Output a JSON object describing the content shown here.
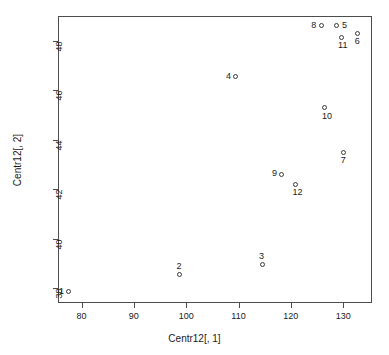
{
  "chart_data": {
    "type": "scatter",
    "title": "",
    "xlabel": "Centr12[, 1]",
    "ylabel": "Centr12[, 2]",
    "xlim": [
      75.5,
      135.5
    ],
    "ylim": [
      37.4,
      49.0
    ],
    "xticks": [
      80,
      90,
      100,
      110,
      120,
      130
    ],
    "yticks": [
      38,
      40,
      42,
      44,
      46,
      48
    ],
    "grid": false,
    "legend": null,
    "marker": "open-circle",
    "points": [
      {
        "label": "1",
        "x": 77.6,
        "y": 37.85,
        "label_pos": "left"
      },
      {
        "label": "2",
        "x": 98.7,
        "y": 38.55,
        "label_pos": "above"
      },
      {
        "label": "3",
        "x": 114.5,
        "y": 38.95,
        "label_pos": "above"
      },
      {
        "label": "4",
        "x": 109.5,
        "y": 46.55,
        "label_pos": "left"
      },
      {
        "label": "5",
        "x": 128.8,
        "y": 48.6,
        "label_pos": "right"
      },
      {
        "label": "6",
        "x": 132.8,
        "y": 48.3,
        "label_pos": "below"
      },
      {
        "label": "7",
        "x": 130.1,
        "y": 43.5,
        "label_pos": "below"
      },
      {
        "label": "8",
        "x": 125.8,
        "y": 48.6,
        "label_pos": "left"
      },
      {
        "label": "9",
        "x": 118.3,
        "y": 42.6,
        "label_pos": "left"
      },
      {
        "label": "10",
        "x": 126.5,
        "y": 45.3,
        "label_pos": "below"
      },
      {
        "label": "11",
        "x": 129.6,
        "y": 48.15,
        "label_pos": "below"
      },
      {
        "label": "12",
        "x": 120.9,
        "y": 42.2,
        "label_pos": "below"
      }
    ]
  },
  "axes": {
    "x": {
      "title": "Centr12[, 1]",
      "tick_labels": [
        "80",
        "90",
        "100",
        "110",
        "120",
        "130"
      ]
    },
    "y": {
      "title": "Centr12[, 2]",
      "tick_labels": [
        "38",
        "40",
        "42",
        "44",
        "46",
        "48"
      ]
    }
  },
  "colors": {
    "frame": "#4d4d4d",
    "marker": "#3a3a3a",
    "text": "#1a1a1a",
    "background": "#ffffff"
  }
}
